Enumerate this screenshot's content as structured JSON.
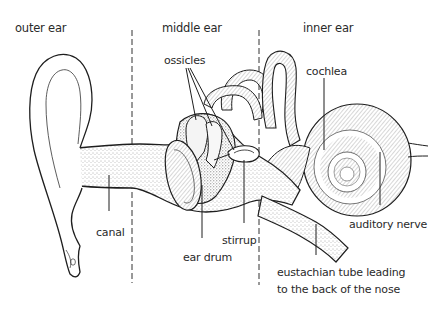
{
  "regions": {
    "outer": "outer ear",
    "middle": "middle ear",
    "inner": "inner ear"
  },
  "labels": {
    "ossicles": "ossicles",
    "cochlea": "cochlea",
    "canal": "canal",
    "ear_drum": "ear drum",
    "stirrup": "stirrup",
    "auditory_nerve": "auditory nerve",
    "eustachian_line1": "eustachian tube leading",
    "eustachian_line2": "to the back of the nose"
  },
  "colors": {
    "line": "#1e1e1e",
    "stipple": "#555555",
    "text": "#2a2a2a",
    "background": "#ffffff"
  }
}
